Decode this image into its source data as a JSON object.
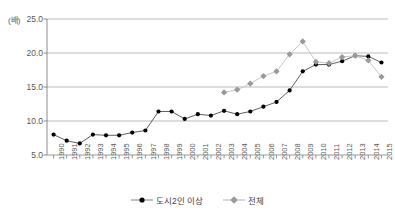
{
  "chart_data": {
    "type": "line",
    "title": "",
    "xlabel": "",
    "ylabel": "(배)",
    "ylim": [
      5.0,
      25.0
    ],
    "ytick_values": [
      5.0,
      10.0,
      15.0,
      20.0,
      25.0
    ],
    "ytick_labels": [
      "5.0",
      "10.0",
      "15.0",
      "20.0",
      "25.0"
    ],
    "grid": true,
    "legend_position": "bottom-center",
    "categories": [
      "1990",
      "1991",
      "1992",
      "1993",
      "1994",
      "1995",
      "1996",
      "1997",
      "1998",
      "1999",
      "2000",
      "2001",
      "2002",
      "2003",
      "2004",
      "2005",
      "2006",
      "2007",
      "2008",
      "2009",
      "2010",
      "2011",
      "2012",
      "2013",
      "2014",
      "2015"
    ],
    "series": [
      {
        "name": "도시2인 이상",
        "color": "#000000",
        "marker": "circle",
        "values": [
          8.0,
          7.1,
          6.7,
          8.0,
          7.9,
          7.9,
          8.3,
          8.6,
          11.4,
          11.4,
          10.3,
          11.0,
          10.8,
          11.5,
          11.0,
          11.4,
          12.1,
          12.8,
          14.5,
          17.3,
          18.3,
          18.3,
          18.8,
          19.6,
          19.5,
          18.6
        ]
      },
      {
        "name": "전체",
        "color": "#999999",
        "marker": "diamond",
        "values": [
          null,
          null,
          null,
          null,
          null,
          null,
          null,
          null,
          null,
          null,
          null,
          null,
          null,
          14.2,
          14.6,
          15.5,
          16.6,
          17.3,
          19.8,
          21.7,
          18.7,
          18.5,
          19.4,
          19.6,
          18.9,
          16.5
        ]
      }
    ]
  },
  "legend": {
    "items": [
      {
        "label": "도시2인 이상"
      },
      {
        "label": "전체"
      }
    ]
  },
  "colors": {
    "series_primary": "#000000",
    "series_secondary": "#999999",
    "grid": "#aaaaaa",
    "axis": "#808080",
    "text": "#595959",
    "background": "#ffffff"
  }
}
